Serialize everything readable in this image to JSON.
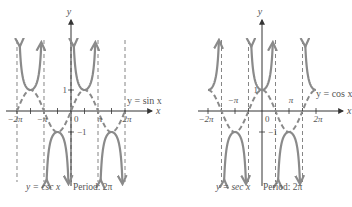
{
  "chart_data": [
    {
      "type": "line",
      "title": "y = csc x",
      "caption": "y = csc x   Period: 2π",
      "caption_func": "y = csc x",
      "caption_period": "Period: 2π",
      "xlabel": "x",
      "ylabel": "y",
      "xlim": [
        -6.8,
        8.5
      ],
      "ylim": [
        -3.4,
        3.4
      ],
      "xticks": [
        {
          "value": -6.2832,
          "label": "−2π"
        },
        {
          "value": -3.1416,
          "label": "−π"
        },
        {
          "value": 3.1416,
          "label": "π"
        },
        {
          "value": 6.2832,
          "label": "2π"
        }
      ],
      "yticks": [
        {
          "value": 1,
          "label": "1"
        },
        {
          "value": -1,
          "label": "−1"
        }
      ],
      "origin_label": "0",
      "asymptotes": [
        -6.2832,
        -3.1416,
        0,
        3.1416,
        6.2832
      ],
      "series": [
        {
          "name": "y = csc x",
          "style": "solid",
          "function": "csc",
          "domain": [
            -6.2832,
            6.2832
          ]
        },
        {
          "name": "y = sin x",
          "style": "dashed",
          "function": "sin",
          "domain": [
            -6.2832,
            6.2832
          ],
          "label": "y = sin x"
        }
      ],
      "grid": false
    },
    {
      "type": "line",
      "title": "y = sec x",
      "caption": "y = sec x   Period: 2π",
      "caption_func": "y = sec x",
      "caption_period": "Period: 2π",
      "xlabel": "x",
      "ylabel": "y",
      "xlim": [
        -7.5,
        8.5
      ],
      "ylim": [
        -3.4,
        3.4
      ],
      "xticks": [
        {
          "value": -6.2832,
          "label": "−2π"
        },
        {
          "value": -3.1416,
          "label": "−π"
        },
        {
          "value": 3.1416,
          "label": "π"
        },
        {
          "value": 6.2832,
          "label": "2π"
        }
      ],
      "yticks": [
        {
          "value": 1,
          "label": "1"
        },
        {
          "value": -1,
          "label": "−1"
        }
      ],
      "origin_label": "0",
      "asymptotes": [
        -4.7124,
        -1.5708,
        1.5708,
        4.7124
      ],
      "series": [
        {
          "name": "y = sec x",
          "style": "solid",
          "function": "sec",
          "domain": [
            -6.2832,
            6.2832
          ]
        },
        {
          "name": "y = cos x",
          "style": "dashed",
          "function": "cos",
          "domain": [
            -6.2832,
            6.2832
          ],
          "label": "y = cos x"
        }
      ],
      "grid": false
    }
  ],
  "colors": {
    "curve": "#8a8a8a",
    "axis": "#333333",
    "text": "#555555"
  }
}
